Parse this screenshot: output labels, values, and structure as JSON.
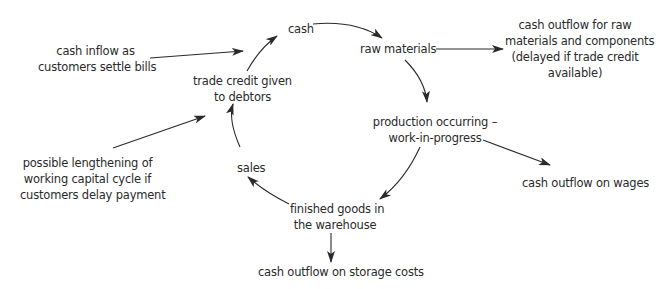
{
  "diagram": {
    "type": "working-capital-cycle",
    "cycle_nodes": [
      {
        "id": "cash",
        "label": "cash"
      },
      {
        "id": "raw_materials",
        "label": "raw materials"
      },
      {
        "id": "production",
        "lines": [
          "production occurring –",
          "work-in-progress"
        ]
      },
      {
        "id": "finished_goods",
        "lines": [
          "finished goods in",
          "the warehouse"
        ]
      },
      {
        "id": "sales",
        "label": "sales"
      },
      {
        "id": "trade_credit",
        "lines": [
          "trade credit given",
          "to debtors"
        ]
      }
    ],
    "external_nodes": [
      {
        "id": "cash_inflow",
        "lines": [
          "cash inflow as",
          "customers settle bills"
        ]
      },
      {
        "id": "lengthening",
        "lines": [
          "possible lengthening of",
          "working capital cycle if",
          "customers delay payment"
        ]
      },
      {
        "id": "outflow_raw",
        "lines": [
          "cash outflow for raw",
          "materials and components",
          "(delayed if trade credit",
          "available)"
        ]
      },
      {
        "id": "outflow_wages",
        "label": "cash outflow on wages"
      },
      {
        "id": "outflow_storage",
        "label": "cash outflow on storage costs"
      }
    ],
    "edges": [
      {
        "from": "cash",
        "to": "raw_materials"
      },
      {
        "from": "raw_materials",
        "to": "production"
      },
      {
        "from": "production",
        "to": "finished_goods"
      },
      {
        "from": "finished_goods",
        "to": "sales"
      },
      {
        "from": "sales",
        "to": "trade_credit"
      },
      {
        "from": "trade_credit",
        "to": "cash"
      },
      {
        "from": "cash_inflow",
        "to": "cash"
      },
      {
        "from": "lengthening",
        "to": "trade_credit"
      },
      {
        "from": "raw_materials",
        "to": "outflow_raw"
      },
      {
        "from": "production",
        "to": "outflow_wages"
      },
      {
        "from": "finished_goods",
        "to": "outflow_storage"
      }
    ],
    "colors": {
      "line": "#2a2a2a",
      "text": "#2a2a2a",
      "background": "#ffffff"
    }
  }
}
